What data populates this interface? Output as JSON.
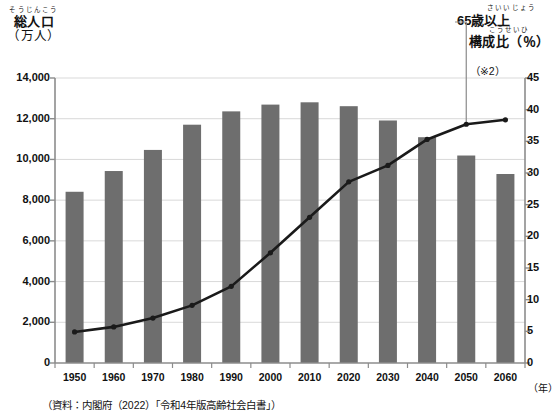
{
  "axes": {
    "left_title_ruby": "そうじんこう",
    "left_title_main": "総人口",
    "left_title_sub": "（万人）",
    "right_title_ruby": "こうせいひ",
    "right_title_main": "構成比（％）",
    "right_title_note": "（※2）",
    "x_unit": "（年）"
  },
  "callout": {
    "ruby": "さいいじょう",
    "label": "65歳以上"
  },
  "source_note": "（資料：内閣府（2022）「令和4年版高齢社会白書」）",
  "colors": {
    "bar": "#6e6e6e",
    "line": "#1a1a1a",
    "grid": "#d9d9d9",
    "axis": "#8c8c8c",
    "background": "#ffffff"
  },
  "chart_data": {
    "type": "bar",
    "title": "",
    "xlabel": "（年）",
    "ylabel": "総人口（万人）",
    "grid": true,
    "legend": false,
    "categories": [
      "1950",
      "1960",
      "1970",
      "1980",
      "1990",
      "2000",
      "2010",
      "2020",
      "2030",
      "2040",
      "2050",
      "2060"
    ],
    "series": [
      {
        "name": "総人口（万人）",
        "type": "bar",
        "axis": "left",
        "unit": "万人",
        "values": [
          8411,
          9430,
          10467,
          11706,
          12361,
          12693,
          12806,
          12615,
          11913,
          11092,
          10192,
          9284
        ],
        "ylim": [
          0,
          14000
        ],
        "yticks": [
          "0",
          "2,000",
          "4,000",
          "6,000",
          "8,000",
          "10,000",
          "12,000",
          "14,000"
        ]
      },
      {
        "name": "65歳以上構成比（％）",
        "type": "line",
        "axis": "right",
        "unit": "％",
        "values": [
          4.9,
          5.7,
          7.1,
          9.1,
          12.1,
          17.4,
          23.0,
          28.6,
          31.2,
          35.3,
          37.7,
          38.4
        ],
        "ylim": [
          0,
          45
        ],
        "yticks": [
          "0",
          "5",
          "10",
          "15",
          "20",
          "25",
          "30",
          "35",
          "40",
          "45"
        ]
      }
    ]
  }
}
